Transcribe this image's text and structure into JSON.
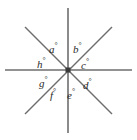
{
  "figure": {
    "background_color": "#ffffff",
    "line_color": "#6e6e6e",
    "vertex_color": "#3a3a3a",
    "label_color": "#2b2b2b",
    "degree_symbol": "°",
    "center": {
      "x": 68,
      "y": 70
    },
    "lines": [
      {
        "name": "vertical-line",
        "x1": 68,
        "y1": 8,
        "x2": 68,
        "y2": 133
      },
      {
        "name": "horizontal-line",
        "x1": 5,
        "y1": 70,
        "x2": 132,
        "y2": 70
      },
      {
        "name": "diagonal-line-nw-se",
        "x1": 25,
        "y1": 27,
        "x2": 112,
        "y2": 114
      },
      {
        "name": "diagonal-line-ne-sw",
        "x1": 112,
        "y1": 27,
        "x2": 25,
        "y2": 114
      }
    ],
    "labels": [
      {
        "id": "a",
        "text": "a",
        "suffix": "°",
        "position": "upper-left-of-vertical"
      },
      {
        "id": "b",
        "text": "b",
        "suffix": "°",
        "position": "upper-right-of-vertical"
      },
      {
        "id": "c",
        "text": "c",
        "suffix": "°",
        "position": "right-upper"
      },
      {
        "id": "d",
        "text": "d",
        "suffix": "°",
        "position": "right-lower"
      },
      {
        "id": "e",
        "text": "e",
        "suffix": "°",
        "position": "lower-right-of-vertical"
      },
      {
        "id": "f",
        "text": "f",
        "suffix": "°",
        "position": "lower-left-of-vertical"
      },
      {
        "id": "g",
        "text": "g",
        "suffix": "°",
        "position": "left-lower"
      },
      {
        "id": "h",
        "text": "h",
        "suffix": "°",
        "position": "left-upper"
      }
    ]
  }
}
